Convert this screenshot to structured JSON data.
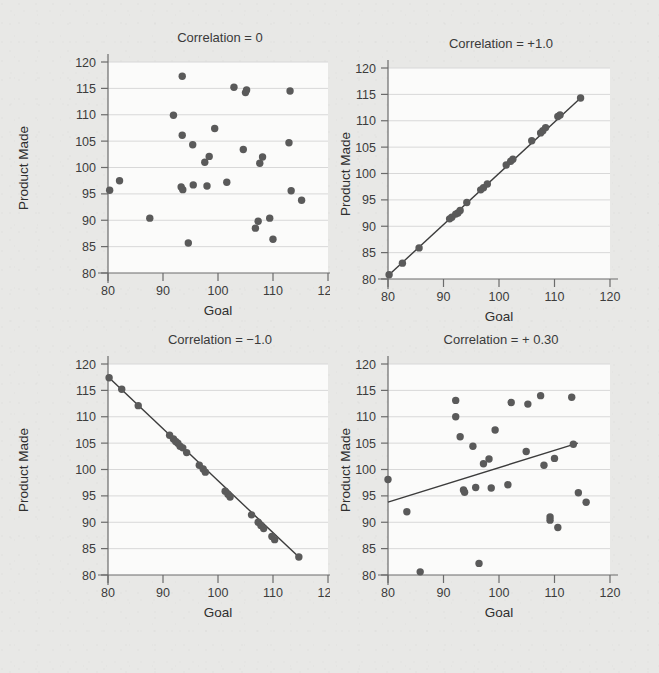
{
  "page": {
    "background_color": "#e8e8e6",
    "plot_background_color": "#fbfbfa",
    "point_color": "#5a5a5a",
    "line_color": "#3c3c3c",
    "gridline_color": "#d8d8d8",
    "axis_color": "#6b6b6b"
  },
  "chart_data": [
    {
      "id": "panel-top-left",
      "type": "scatter",
      "title": "Correlation = 0",
      "xlabel": "Goal",
      "ylabel": "Product  Made",
      "xlim": [
        80,
        120
      ],
      "ylim": [
        80,
        120
      ],
      "xticks": [
        80,
        90,
        100,
        110,
        120
      ],
      "yticks": [
        80,
        85,
        90,
        95,
        100,
        105,
        110,
        115,
        120
      ],
      "grid": "horizontal",
      "legend": "none",
      "fit_line": null,
      "points": [
        [
          80.3,
          95.7
        ],
        [
          82.1,
          97.5
        ],
        [
          87.6,
          90.4
        ],
        [
          91.9,
          109.9
        ],
        [
          93.5,
          117.3
        ],
        [
          93.5,
          106.1
        ],
        [
          93.3,
          96.3
        ],
        [
          93.6,
          95.8
        ],
        [
          94.6,
          85.7
        ],
        [
          95.4,
          104.3
        ],
        [
          95.5,
          96.7
        ],
        [
          97.6,
          101.0
        ],
        [
          98.4,
          102.1
        ],
        [
          98.0,
          96.5
        ],
        [
          99.4,
          107.4
        ],
        [
          101.6,
          97.2
        ],
        [
          102.9,
          115.2
        ],
        [
          104.6,
          103.4
        ],
        [
          105.0,
          114.2
        ],
        [
          105.2,
          114.7
        ],
        [
          106.8,
          88.5
        ],
        [
          107.3,
          89.8
        ],
        [
          107.6,
          100.8
        ],
        [
          108.1,
          102.0
        ],
        [
          109.4,
          90.4
        ],
        [
          110.0,
          86.4
        ],
        [
          112.9,
          104.7
        ],
        [
          113.1,
          114.5
        ],
        [
          113.3,
          95.6
        ],
        [
          115.2,
          93.8
        ]
      ]
    },
    {
      "id": "panel-top-right",
      "type": "scatter",
      "title": "Correlation = +1.0",
      "xlabel": "Goal",
      "ylabel": "Product Made",
      "xlim": [
        80,
        120
      ],
      "ylim": [
        80,
        120
      ],
      "xticks": [
        80,
        90,
        100,
        110,
        120
      ],
      "yticks": [
        80,
        85,
        90,
        95,
        100,
        105,
        110,
        115,
        120
      ],
      "grid": "horizontal",
      "legend": "none",
      "fit_line": {
        "x1": 80.2,
        "y1": 80.8,
        "x2": 114.7,
        "y2": 114.3
      },
      "points": [
        [
          80.2,
          80.8
        ],
        [
          82.6,
          83.0
        ],
        [
          85.6,
          85.9
        ],
        [
          91.1,
          91.4
        ],
        [
          91.5,
          91.7
        ],
        [
          92.2,
          92.3
        ],
        [
          92.6,
          92.5
        ],
        [
          93.0,
          93.0
        ],
        [
          94.2,
          94.5
        ],
        [
          96.7,
          96.9
        ],
        [
          97.2,
          97.3
        ],
        [
          97.9,
          98.0
        ],
        [
          101.3,
          101.6
        ],
        [
          102.1,
          102.3
        ],
        [
          102.5,
          102.7
        ],
        [
          105.9,
          106.2
        ],
        [
          107.5,
          107.7
        ],
        [
          107.9,
          108.1
        ],
        [
          108.4,
          108.7
        ],
        [
          110.6,
          110.8
        ],
        [
          111.0,
          111.1
        ],
        [
          114.7,
          114.3
        ]
      ]
    },
    {
      "id": "panel-bottom-left",
      "type": "scatter",
      "title": "Correlation = −1.0",
      "xlabel": "Goal",
      "ylabel": "Product Made",
      "xlim": [
        80,
        120
      ],
      "ylim": [
        80,
        120
      ],
      "xticks": [
        80,
        90,
        100,
        110,
        120
      ],
      "yticks": [
        80,
        85,
        90,
        95,
        100,
        105,
        110,
        115,
        120
      ],
      "grid": "horizontal",
      "legend": "none",
      "fit_line": {
        "x1": 80.2,
        "y1": 117.4,
        "x2": 114.7,
        "y2": 83.4
      },
      "points": [
        [
          80.2,
          117.4
        ],
        [
          82.5,
          115.2
        ],
        [
          85.5,
          112.1
        ],
        [
          91.2,
          106.5
        ],
        [
          91.9,
          105.8
        ],
        [
          92.3,
          105.3
        ],
        [
          92.7,
          105.0
        ],
        [
          93.1,
          104.4
        ],
        [
          93.6,
          104.1
        ],
        [
          94.3,
          103.2
        ],
        [
          96.6,
          100.8
        ],
        [
          97.3,
          100.1
        ],
        [
          97.7,
          99.5
        ],
        [
          101.3,
          95.9
        ],
        [
          101.8,
          95.3
        ],
        [
          102.2,
          94.8
        ],
        [
          106.1,
          91.4
        ],
        [
          107.3,
          90.0
        ],
        [
          107.8,
          89.4
        ],
        [
          108.3,
          88.8
        ],
        [
          109.8,
          87.3
        ],
        [
          110.3,
          86.7
        ],
        [
          114.7,
          83.4
        ]
      ]
    },
    {
      "id": "panel-bottom-right",
      "type": "scatter",
      "title": "Correlation = + 0.30",
      "xlabel": "Goal",
      "ylabel": "Product Made",
      "xlim": [
        80,
        120
      ],
      "ylim": [
        80,
        120
      ],
      "xticks": [
        80,
        90,
        100,
        110,
        120
      ],
      "yticks": [
        80,
        85,
        90,
        95,
        100,
        105,
        110,
        115,
        120
      ],
      "grid": "horizontal",
      "legend": "none",
      "fit_line": {
        "x1": 80.0,
        "y1": 93.8,
        "x2": 114.2,
        "y2": 105.0
      },
      "points": [
        [
          80.0,
          98.1
        ],
        [
          83.4,
          92.0
        ],
        [
          85.8,
          80.6
        ],
        [
          92.2,
          113.1
        ],
        [
          92.2,
          110.0
        ],
        [
          93.0,
          106.2
        ],
        [
          93.6,
          96.1
        ],
        [
          93.8,
          95.7
        ],
        [
          95.3,
          104.4
        ],
        [
          95.8,
          96.6
        ],
        [
          96.4,
          82.2
        ],
        [
          97.2,
          101.1
        ],
        [
          98.2,
          102.0
        ],
        [
          98.6,
          96.5
        ],
        [
          99.3,
          107.5
        ],
        [
          101.6,
          97.1
        ],
        [
          102.2,
          112.7
        ],
        [
          104.9,
          103.4
        ],
        [
          105.2,
          112.4
        ],
        [
          107.5,
          114.0
        ],
        [
          108.1,
          100.8
        ],
        [
          109.2,
          91.0
        ],
        [
          109.2,
          90.4
        ],
        [
          110.0,
          102.1
        ],
        [
          110.6,
          89.0
        ],
        [
          113.1,
          113.7
        ],
        [
          113.4,
          104.8
        ],
        [
          114.3,
          95.6
        ],
        [
          115.7,
          93.8
        ]
      ]
    }
  ]
}
